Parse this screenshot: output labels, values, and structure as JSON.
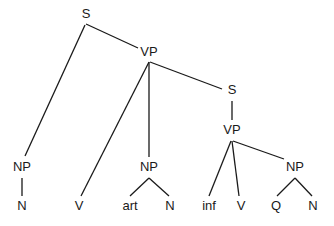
{
  "diagram": {
    "type": "syntax-tree",
    "nodes": [
      {
        "id": "s1",
        "label": "S",
        "x": 86,
        "y": 15
      },
      {
        "id": "vp1",
        "label": "VP",
        "x": 149,
        "y": 53
      },
      {
        "id": "np1",
        "label": "NP",
        "x": 22,
        "y": 168
      },
      {
        "id": "n1",
        "label": "N",
        "x": 22,
        "y": 207
      },
      {
        "id": "v1",
        "label": "V",
        "x": 79,
        "y": 207
      },
      {
        "id": "np2",
        "label": "NP",
        "x": 149,
        "y": 168
      },
      {
        "id": "art",
        "label": "art",
        "x": 130,
        "y": 207
      },
      {
        "id": "n2",
        "label": "N",
        "x": 170,
        "y": 207
      },
      {
        "id": "s2",
        "label": "S",
        "x": 232,
        "y": 91
      },
      {
        "id": "vp2",
        "label": "VP",
        "x": 232,
        "y": 131
      },
      {
        "id": "inf",
        "label": "inf",
        "x": 209,
        "y": 207
      },
      {
        "id": "v2",
        "label": "V",
        "x": 241,
        "y": 207
      },
      {
        "id": "np3",
        "label": "NP",
        "x": 295,
        "y": 168
      },
      {
        "id": "q",
        "label": "Q",
        "x": 276,
        "y": 207
      },
      {
        "id": "n3",
        "label": "N",
        "x": 313,
        "y": 207
      }
    ],
    "edges": [
      {
        "from": "s1",
        "to": "np1",
        "x1": 85,
        "y1": 25,
        "x2": 25,
        "y2": 156
      },
      {
        "from": "s1",
        "to": "vp1",
        "x1": 86,
        "y1": 24,
        "x2": 138,
        "y2": 48
      },
      {
        "from": "vp1",
        "to": "v1",
        "x1": 149,
        "y1": 62,
        "x2": 81,
        "y2": 196
      },
      {
        "from": "vp1",
        "to": "np2",
        "x1": 149,
        "y1": 62,
        "x2": 149,
        "y2": 157
      },
      {
        "from": "vp1",
        "to": "s2",
        "x1": 150,
        "y1": 62,
        "x2": 222,
        "y2": 89
      },
      {
        "from": "np1",
        "to": "n1",
        "x1": 22,
        "y1": 178,
        "x2": 22,
        "y2": 196
      },
      {
        "from": "np2",
        "to": "art",
        "x1": 149,
        "y1": 178,
        "x2": 130,
        "y2": 196
      },
      {
        "from": "np2",
        "to": "n2",
        "x1": 149,
        "y1": 178,
        "x2": 169,
        "y2": 196
      },
      {
        "from": "s2",
        "to": "vp2",
        "x1": 232,
        "y1": 101,
        "x2": 232,
        "y2": 120
      },
      {
        "from": "vp2",
        "to": "inf",
        "x1": 231,
        "y1": 141,
        "x2": 209,
        "y2": 196
      },
      {
        "from": "vp2",
        "to": "v2",
        "x1": 232,
        "y1": 141,
        "x2": 239,
        "y2": 196
      },
      {
        "from": "vp2",
        "to": "np3",
        "x1": 233,
        "y1": 141,
        "x2": 284,
        "y2": 159
      },
      {
        "from": "np3",
        "to": "q",
        "x1": 295,
        "y1": 178,
        "x2": 277,
        "y2": 196
      },
      {
        "from": "np3",
        "to": "n3",
        "x1": 295,
        "y1": 178,
        "x2": 312,
        "y2": 196
      }
    ]
  }
}
